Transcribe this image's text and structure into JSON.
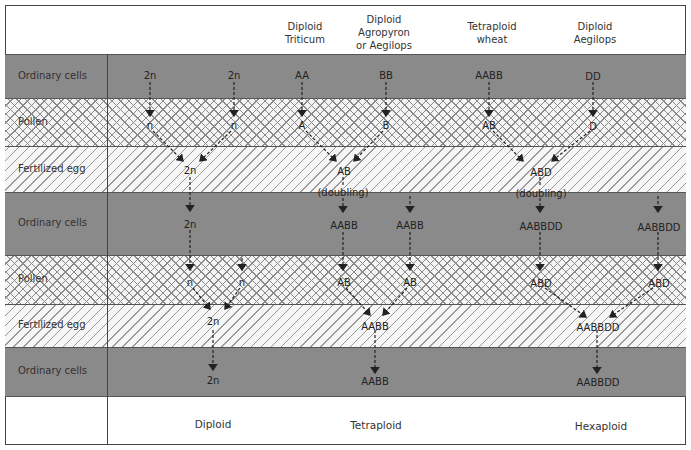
{
  "header": {
    "columns": [
      {
        "label_lines": [
          "Diploid",
          "Triticum"
        ]
      },
      {
        "label_lines": [
          "Diploid",
          "Agropyron",
          "or Aegilops"
        ]
      },
      {
        "label_lines": [
          "Tetraploid",
          "wheat"
        ]
      },
      {
        "label_lines": [
          "Diploid",
          "Aegilops"
        ]
      }
    ]
  },
  "rows": [
    {
      "label": "Ordinary cells",
      "type": "ordinary"
    },
    {
      "label": "Pollen",
      "type": "pollen"
    },
    {
      "label": "Fertilized egg",
      "type": "fertilized"
    },
    {
      "label": "Ordinary cells",
      "type": "ordinary"
    },
    {
      "label": "Pollen",
      "type": "pollen"
    },
    {
      "label": "Fertilized egg",
      "type": "fertilized"
    },
    {
      "label": "Ordinary cells",
      "type": "ordinary"
    }
  ],
  "genomes": {
    "r1": [
      "2n",
      "2n",
      "AA",
      "BB",
      "AABB",
      "DD"
    ],
    "r2": [
      "n",
      "n",
      "A",
      "B",
      "AB",
      "D"
    ],
    "r3": [
      "2n",
      "AB",
      "(doubling)",
      "ABD",
      "(doubling)"
    ],
    "r4": [
      "2n",
      "AABB",
      "AABB",
      "AABBDD",
      "AABBDD"
    ],
    "r5": [
      "n",
      "n",
      "AB",
      "AB",
      "ABD",
      "ABD"
    ],
    "r6": [
      "2n",
      "AABB",
      "AABBDD"
    ],
    "r7": [
      "2n",
      "AABB",
      "AABBDD"
    ]
  },
  "footer": {
    "ploidy": [
      "Diploid",
      "Tetraploid",
      "Hexaploid"
    ]
  },
  "colors": {
    "ordinary_band": "#8a8a8a",
    "hatch": "#8a8a8a",
    "line": "#444444"
  }
}
